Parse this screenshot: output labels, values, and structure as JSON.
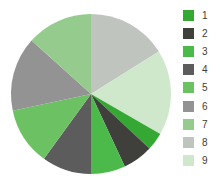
{
  "chart_data": {
    "type": "pie",
    "title": "",
    "legend_position": "right",
    "start_angle_deg": 0,
    "direction": "clockwise",
    "center": {
      "x": 91,
      "y": 94
    },
    "radius": 80,
    "categories": [
      "1",
      "2",
      "3",
      "4",
      "5",
      "6",
      "7",
      "8",
      "9"
    ],
    "values": [
      3.5,
      6.0,
      7.0,
      10.0,
      11.5,
      15.0,
      14.0,
      16.0,
      17.0
    ],
    "slice_order_clockwise_from_12oclock": [
      "8",
      "9",
      "1",
      "2",
      "3",
      "4",
      "5",
      "6",
      "7"
    ],
    "colors": {
      "1": "#34a832",
      "2": "#3f3f3c",
      "3": "#4cba4a",
      "4": "#5c5c5c",
      "5": "#6cc263",
      "6": "#939393",
      "7": "#95cc8e",
      "8": "#bfc4bf",
      "9": "#cfe8cb"
    },
    "slices": [
      {
        "label": "8",
        "color": "#bfc4bf",
        "start_deg": 0,
        "end_deg": 58
      },
      {
        "label": "9",
        "color": "#cfe8cb",
        "start_deg": 58,
        "end_deg": 120
      },
      {
        "label": "1",
        "color": "#34a832",
        "start_deg": 120,
        "end_deg": 133
      },
      {
        "label": "2",
        "color": "#3f3f3c",
        "start_deg": 133,
        "end_deg": 155
      },
      {
        "label": "3",
        "color": "#4cba4a",
        "start_deg": 155,
        "end_deg": 180
      },
      {
        "label": "4",
        "color": "#5c5c5c",
        "start_deg": 180,
        "end_deg": 216
      },
      {
        "label": "5",
        "color": "#6cc263",
        "start_deg": 216,
        "end_deg": 258
      },
      {
        "label": "6",
        "color": "#939393",
        "start_deg": 258,
        "end_deg": 312
      },
      {
        "label": "7",
        "color": "#95cc8e",
        "start_deg": 312,
        "end_deg": 360
      }
    ]
  },
  "legend": {
    "items": [
      {
        "label": "1",
        "color": "#34a832"
      },
      {
        "label": "2",
        "color": "#3f3f3c"
      },
      {
        "label": "3",
        "color": "#4cba4a"
      },
      {
        "label": "4",
        "color": "#5c5c5c"
      },
      {
        "label": "5",
        "color": "#6cc263"
      },
      {
        "label": "6",
        "color": "#939393"
      },
      {
        "label": "7",
        "color": "#95cc8e"
      },
      {
        "label": "8",
        "color": "#bfc4bf"
      },
      {
        "label": "9",
        "color": "#cfe8cb"
      }
    ]
  },
  "background_color": "#ffffff"
}
